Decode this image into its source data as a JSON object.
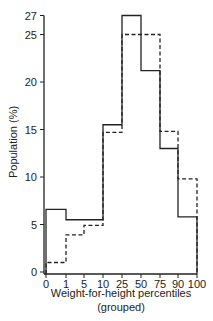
{
  "chart_data": {
    "type": "bar",
    "style": "step-histogram",
    "title": "",
    "xlabel": "Weight-for-height percentiles",
    "xlabel_line2": "(grouped)",
    "ylabel": "Population (%)",
    "ylim": [
      0,
      27
    ],
    "yticks": [
      0,
      5,
      10,
      15,
      20,
      25,
      27
    ],
    "xticks": [
      "0",
      "1",
      "5",
      "10",
      "25",
      "50",
      "75",
      "90",
      "100"
    ],
    "categories": [
      "0-1",
      "1-5",
      "5-10",
      "10-25",
      "25-50",
      "50-75",
      "75-90",
      "90-100"
    ],
    "series": [
      {
        "name": "solid",
        "line": "solid",
        "values": [
          6.6,
          5.5,
          5.5,
          15.5,
          27.0,
          21.2,
          13.0,
          5.8
        ]
      },
      {
        "name": "dashed",
        "line": "dashed",
        "values": [
          1.0,
          3.9,
          4.9,
          14.7,
          25.0,
          25.0,
          14.8,
          9.8
        ]
      }
    ],
    "grid": false,
    "legend": null
  }
}
